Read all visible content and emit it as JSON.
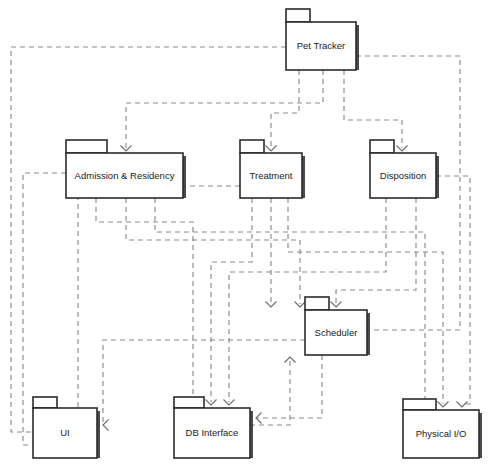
{
  "diagram": {
    "type": "uml-package-diagram",
    "canvas": {
      "width": 490,
      "height": 472,
      "background": "#ffffff"
    },
    "style": {
      "package_fill": "#ffffff",
      "package_stroke": "#2b2b2b",
      "dependency_stroke": "#8a8a8a",
      "label_color": "#1a1a1a",
      "dash_pattern": "5 4"
    },
    "packages": [
      {
        "id": "pet-tracker",
        "label": "Pet Tracker",
        "x": 286,
        "y": 22,
        "w": 70,
        "h": 48,
        "tab_w": 24,
        "tab_h": 13
      },
      {
        "id": "admission-residency",
        "label": "Admission  & Residency",
        "x": 66,
        "y": 153,
        "w": 117,
        "h": 45,
        "tab_w": 41,
        "tab_h": 13
      },
      {
        "id": "treatment",
        "label": "Treatment",
        "x": 240,
        "y": 153,
        "w": 62,
        "h": 45,
        "tab_w": 24,
        "tab_h": 13
      },
      {
        "id": "disposition",
        "label": "Disposition",
        "x": 370,
        "y": 153,
        "w": 66,
        "h": 45,
        "tab_w": 24,
        "tab_h": 13
      },
      {
        "id": "scheduler",
        "label": "Scheduler",
        "x": 305,
        "y": 310,
        "w": 62,
        "h": 45,
        "tab_w": 24,
        "tab_h": 13
      },
      {
        "id": "ui",
        "label": "UI",
        "x": 33,
        "y": 408,
        "w": 64,
        "h": 50,
        "tab_w": 24,
        "tab_h": 11
      },
      {
        "id": "db-interface",
        "label": "DB Interface",
        "x": 174,
        "y": 408,
        "w": 76,
        "h": 50,
        "tab_w": 30,
        "tab_h": 11
      },
      {
        "id": "physical-io",
        "label": "Physical I/O",
        "x": 403,
        "y": 410,
        "w": 76,
        "h": 48,
        "tab_w": 33,
        "tab_h": 11
      }
    ],
    "dependencies": [
      {
        "from": "pet-tracker",
        "to": "admission-residency",
        "path": "M 323 70 L 323 103 L 126 103 L 126 148",
        "arrow_at": [
          126,
          151
        ],
        "arrow_dir": "down"
      },
      {
        "from": "pet-tracker",
        "to": "treatment",
        "path": "M 299 70 L 299 113 L 271 113 L 271 148",
        "arrow_at": [
          271,
          151
        ],
        "arrow_dir": "down"
      },
      {
        "from": "pet-tracker",
        "to": "disposition",
        "path": "M 344 70 L 344 120 L 402 120 L 402 148",
        "arrow_at": [
          402,
          151
        ],
        "arrow_dir": "down"
      },
      {
        "from": "pet-tracker",
        "to": "ui",
        "path": "M 286 47 L 11 47 L 11 432 L 60 432",
        "arrow_at": [
          66,
          432
        ],
        "arrow_dir": "right"
      },
      {
        "from": "pet-tracker",
        "to": "scheduler",
        "path": "M 356 56 L 460 56 L 460 330 L 372 330",
        "arrow_at": [
          367,
          330
        ],
        "arrow_dir": "right"
      },
      {
        "from": "admission-residency",
        "to": "ui",
        "path": "M 66 173 L 23 173 L 23 445 L 60 445",
        "arrow_at": [
          66,
          445
        ],
        "arrow_dir": "right"
      },
      {
        "from": "admission-residency",
        "to": "db-interface",
        "path": "M 96 198 L 96 222 L 193 222 L 193 402",
        "arrow_at": [
          193,
          405
        ],
        "arrow_dir": "down"
      },
      {
        "from": "admission-residency",
        "to": "scheduler",
        "path": "M 126 198 L 126 240 L 300 240 L 300 304",
        "arrow_at": [
          300,
          307
        ],
        "arrow_dir": "down"
      },
      {
        "from": "admission-residency",
        "to": "physical-io",
        "path": "M 155 198 L 155 232 L 425 232 L 425 404",
        "arrow_at": [
          425,
          407
        ],
        "arrow_dir": "down"
      },
      {
        "from": "treatment",
        "to": "db-interface",
        "path": "M 252 198 L 252 262 L 211 262 L 211 402",
        "arrow_at": [
          211,
          405
        ],
        "arrow_dir": "down"
      },
      {
        "from": "treatment",
        "to": "scheduler",
        "path": "M 271 198 L 271 304",
        "arrow_at": [
          271,
          307
        ],
        "arrow_dir": "down"
      },
      {
        "from": "treatment",
        "to": "physical-io",
        "path": "M 288 198 L 288 252 L 443 252 L 443 404",
        "arrow_at": [
          443,
          407
        ],
        "arrow_dir": "down"
      },
      {
        "from": "treatment",
        "to": "ui",
        "path": "M 240 186 L 78 186 L 78 440 L 60 440",
        "arrow_at": [
          66,
          440
        ],
        "arrow_dir": "right"
      },
      {
        "from": "disposition",
        "to": "db-interface",
        "path": "M 386 198 L 386 272 L 229 272 L 229 402",
        "arrow_at": [
          229,
          405
        ],
        "arrow_dir": "down"
      },
      {
        "from": "disposition",
        "to": "scheduler",
        "path": "M 416 198 L 416 290 L 336 290 L 336 304",
        "arrow_at": [
          336,
          307
        ],
        "arrow_dir": "down"
      },
      {
        "from": "disposition",
        "to": "physical-io",
        "path": "M 436 176 L 470 176 L 470 404 L 462 404",
        "arrow_at": [
          462,
          407
        ],
        "arrow_dir": "down"
      },
      {
        "from": "scheduler",
        "to": "db-interface",
        "path": "M 322 355 L 322 418 L 256 418 L 256 418",
        "arrow_at": [
          256,
          418
        ],
        "arrow_dir": "left"
      },
      {
        "from": "scheduler",
        "to": "ui",
        "path": "M 305 340 L 103 340 L 103 425 L 103 425",
        "arrow_at": [
          103,
          425
        ],
        "arrow_dir": "left"
      },
      {
        "from": "db-interface",
        "to": "scheduler",
        "path": "M 250 425 L 290 425 L 290 360",
        "arrow_at": [
          290,
          357
        ],
        "arrow_dir": "up"
      }
    ]
  }
}
